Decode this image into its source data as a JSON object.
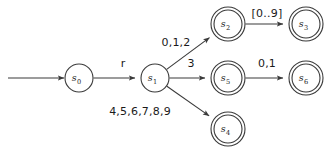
{
  "diagram": {
    "type": "finite-state-machine",
    "title": "",
    "background_color": "#ffffff",
    "stroke_color": "#3a3a3a",
    "text_color": "#1a1a1a",
    "start_arrow": {
      "name": "start-arrow",
      "from_x": 8,
      "to_x": 64,
      "y": 78
    },
    "states": [
      {
        "id": "s0",
        "label": "s",
        "subscript": "0",
        "x": 79,
        "y": 78,
        "radius": 14,
        "accepting": false
      },
      {
        "id": "s1",
        "label": "s",
        "subscript": "1",
        "x": 155,
        "y": 78,
        "radius": 14,
        "accepting": false
      },
      {
        "id": "s2",
        "label": "s",
        "subscript": "2",
        "x": 228,
        "y": 24,
        "radius": 14,
        "accepting": true
      },
      {
        "id": "s3",
        "label": "s",
        "subscript": "3",
        "x": 306,
        "y": 24,
        "radius": 14,
        "accepting": true
      },
      {
        "id": "s5",
        "label": "s",
        "subscript": "5",
        "x": 228,
        "y": 78,
        "radius": 14,
        "accepting": true
      },
      {
        "id": "s6",
        "label": "s",
        "subscript": "6",
        "x": 306,
        "y": 78,
        "radius": 14,
        "accepting": true
      },
      {
        "id": "s4",
        "label": "s",
        "subscript": "4",
        "x": 228,
        "y": 129,
        "radius": 14,
        "accepting": true
      }
    ],
    "transitions": [
      {
        "id": "t-s0-s1",
        "from": "s0",
        "to": "s1",
        "label": "r",
        "label_x": 123,
        "label_y": 67
      },
      {
        "id": "t-s1-s2",
        "from": "s1",
        "to": "s2",
        "label": "0,1,2",
        "label_x": 176,
        "label_y": 46
      },
      {
        "id": "t-s2-s3",
        "from": "s2",
        "to": "s3",
        "label": "[0..9]",
        "label_x": 267,
        "label_y": 17
      },
      {
        "id": "t-s1-s5",
        "from": "s1",
        "to": "s5",
        "label": "3",
        "label_x": 191,
        "label_y": 67
      },
      {
        "id": "t-s5-s6",
        "from": "s5",
        "to": "s6",
        "label": "0,1",
        "label_x": 267,
        "label_y": 67
      },
      {
        "id": "t-s1-s4",
        "from": "s1",
        "to": "s4",
        "label": "4,5,6,7,8,9",
        "label_x": 140,
        "label_y": 115
      }
    ]
  }
}
